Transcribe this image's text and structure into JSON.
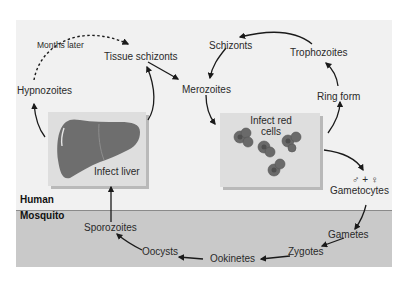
{
  "zones": {
    "human": "Human",
    "mosquito": "Mosquito"
  },
  "liver_stage": {
    "hypnozoites": "Hypnozoites",
    "months_later": "Months later",
    "tissue_schizonts": "Tissue schizonts",
    "infect_liver": "Infect liver"
  },
  "blood_stage": {
    "merozoites": "Merozoites",
    "schizonts": "Schizonts",
    "trophozoites": "Trophozoites",
    "ring_form": "Ring form",
    "infect_red_cells": "Infect red cells",
    "sex_symbols": "♂ + ♀",
    "gametocytes": "Gametocytes"
  },
  "mosquito_stage": {
    "gametes": "Gametes",
    "zygotes": "Zygotes",
    "ookinetes": "Ookinetes",
    "oocysts": "Oocysts",
    "sporozoites": "Sporozoites"
  },
  "colors": {
    "human_bg": "#f1f1f1",
    "mosquito_bg": "#c9c9c9",
    "box_bg": "#dedede",
    "organ": "#6e6e6e",
    "arrow": "#1a1a1a"
  }
}
